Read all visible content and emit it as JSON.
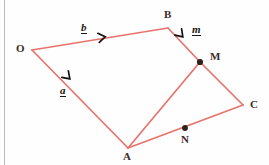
{
  "figure": {
    "canvas": {
      "width": 269,
      "height": 165
    },
    "colors": {
      "line": "#e8736b",
      "line_light": "#ef8a83",
      "marker": "#2b201c",
      "label": "#3a2c28",
      "vector_label": "#1c1713",
      "border": "#b9bcbe",
      "background": "#fefefe"
    },
    "vertices": [
      {
        "name": "O",
        "label": "O",
        "x": 32,
        "y": 50,
        "label_x": 16,
        "label_y": 44
      },
      {
        "name": "B",
        "label": "B",
        "x": 168,
        "y": 28,
        "label_x": 164,
        "label_y": 10
      },
      {
        "name": "M",
        "label": "M",
        "x": 200,
        "y": 62,
        "label_x": 210,
        "label_y": 53
      },
      {
        "name": "C",
        "label": "C",
        "x": 243,
        "y": 105,
        "label_x": 250,
        "label_y": 100
      },
      {
        "name": "N",
        "label": "N",
        "x": 185,
        "y": 128,
        "label_x": 181,
        "label_y": 136
      },
      {
        "name": "A",
        "label": "A",
        "x": 128,
        "y": 148,
        "label_x": 123,
        "label_y": 152
      }
    ],
    "marker_points": [
      {
        "name": "M",
        "x": 200,
        "y": 62,
        "r": 3.1
      },
      {
        "name": "N",
        "x": 185,
        "y": 128,
        "r": 2.9
      }
    ],
    "segments": [
      {
        "name": "O-B",
        "from": "O",
        "to": "B",
        "x1": 32,
        "y1": 50,
        "x2": 168,
        "y2": 28
      },
      {
        "name": "O-A",
        "from": "O",
        "to": "A",
        "x1": 32,
        "y1": 50,
        "x2": 128,
        "y2": 148
      },
      {
        "name": "B-M",
        "from": "B",
        "to": "M",
        "x1": 168,
        "y1": 28,
        "x2": 200,
        "y2": 62
      },
      {
        "name": "M-C",
        "from": "M",
        "to": "C",
        "x1": 200,
        "y1": 62,
        "x2": 243,
        "y2": 105
      },
      {
        "name": "C-A",
        "from": "C",
        "to": "A",
        "x1": 243,
        "y1": 105,
        "x2": 128,
        "y2": 148
      },
      {
        "name": "A-M",
        "from": "A",
        "to": "M",
        "x1": 128,
        "y1": 148,
        "x2": 200,
        "y2": 62
      }
    ],
    "arrow_markers": [
      {
        "name": "arrow-on-OB",
        "on": "O-B",
        "x": 104,
        "y": 37,
        "angle": -9
      },
      {
        "name": "arrow-on-OA",
        "on": "O-A",
        "x": 68,
        "y": 77,
        "angle": 45
      },
      {
        "name": "arrow-on-BM",
        "on": "B-M",
        "x": 181,
        "y": 35,
        "angle": 47
      }
    ],
    "vector_labels": [
      {
        "name": "vector-b",
        "text": "b",
        "on": "O-B",
        "x": 82,
        "y": 24
      },
      {
        "name": "vector-a",
        "text": "a",
        "on": "O-A",
        "x": 60,
        "y": 87
      },
      {
        "name": "vector-m",
        "text": "m",
        "on": "B-M",
        "x": 192,
        "y": 26
      }
    ]
  }
}
